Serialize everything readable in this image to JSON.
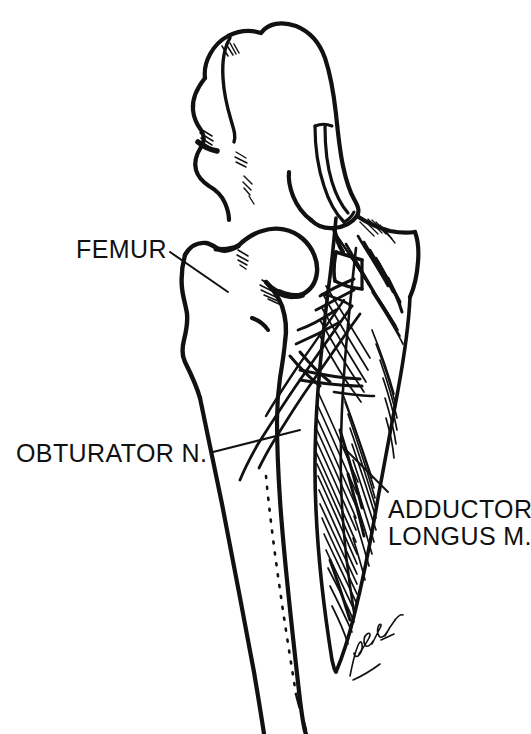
{
  "figure": {
    "kind": "anatomical-line-drawing",
    "background_color": "#ffffff",
    "ink_color": "#111111",
    "width": 531,
    "height": 734
  },
  "labels": {
    "femur": {
      "text": "FEMUR",
      "leader_from": [
        170,
        252
      ],
      "leader_to": [
        228,
        292
      ]
    },
    "obturator_nerve": {
      "text": "OBTURATOR N.",
      "leader_from": [
        213,
        452
      ],
      "leader_to": [
        300,
        430
      ]
    },
    "adductor_longus": {
      "line1": "ADDUCTOR",
      "line2": "LONGUS M.",
      "leader_from": [
        388,
        492
      ],
      "leader_to": [
        344,
        448
      ]
    }
  },
  "structures": [
    {
      "name": "ilium",
      "label_shown": false
    },
    {
      "name": "greater-trochanter",
      "label_shown": false
    },
    {
      "name": "femoral-head",
      "label_shown": false
    },
    {
      "name": "femoral-neck",
      "label_shown": false
    },
    {
      "name": "femoral-shaft",
      "label_shown": false
    },
    {
      "name": "pubic-ramus",
      "label_shown": false
    },
    {
      "name": "adductor-longus-muscle",
      "label_shown": true
    },
    {
      "name": "obturator-nerve",
      "label_shown": true
    }
  ],
  "signature": {
    "text": "artist-signature",
    "position": [
      348,
      632
    ]
  }
}
